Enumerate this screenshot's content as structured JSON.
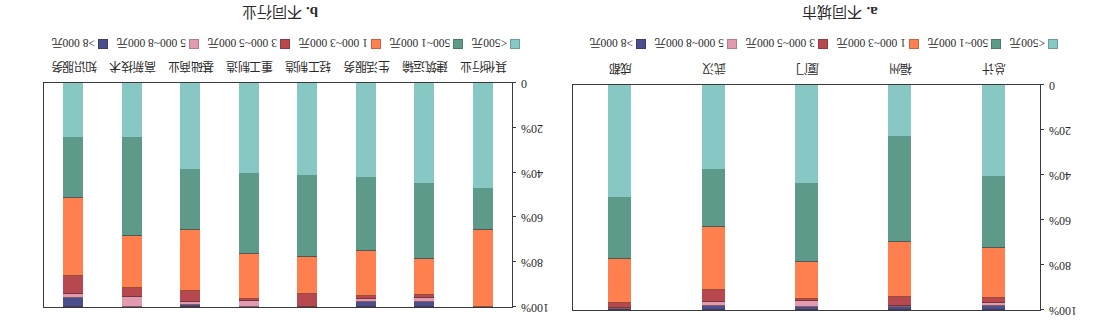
{
  "colors": {
    "lt500": "#87C7C4",
    "r500_1000": "#5E9A8A",
    "r1000_3000": "#FF7F4F",
    "r3000_5000": "#B8484F",
    "r5000_8000": "#E19AB0",
    "gt8000": "#4A4E8C"
  },
  "legend": [
    {
      "key": "lt500",
      "label": "<500元"
    },
    {
      "key": "r500_1000",
      "label": "500~1 000元"
    },
    {
      "key": "r1000_3000",
      "label": "1 000~3 000元"
    },
    {
      "key": "r3000_5000",
      "label": "3 000~5 000元"
    },
    {
      "key": "r5000_8000",
      "label": "5 000~8 000元"
    },
    {
      "key": "gt8000",
      "label": ">8 000元"
    }
  ],
  "y_ticks": [
    "0",
    "20%",
    "40%",
    "60%",
    "80%",
    "100%"
  ],
  "charts": {
    "a": {
      "tag": "a.",
      "title": "不同城市"
    },
    "b": {
      "tag": "b.",
      "title": "不同行业"
    }
  },
  "chart_data": [
    {
      "type": "bar",
      "stacked": true,
      "orientation": "vertical",
      "title": "a. 不同城市",
      "xlabel": "",
      "ylabel": "",
      "ylim": [
        0,
        100
      ],
      "y_ticks": [
        "0",
        "20%",
        "40%",
        "60%",
        "80%",
        "100%"
      ],
      "legend_position": "bottom",
      "rendered_rotation_deg": 180,
      "categories": [
        "总计",
        "福州",
        "厦门",
        "武汉",
        "成都"
      ],
      "series": [
        {
          "name": "<500元",
          "values": [
            40.5,
            22.5,
            43.5,
            37.5,
            50.0
          ]
        },
        {
          "name": "500~1 000元",
          "values": [
            32.0,
            47.5,
            35.0,
            25.5,
            27.5
          ]
        },
        {
          "name": "1 000~3 000元",
          "values": [
            22.0,
            24.5,
            16.5,
            28.0,
            19.5
          ]
        },
        {
          "name": "3 000~5 000元",
          "values": [
            2.3,
            3.7,
            0.8,
            5.5,
            2.0
          ]
        },
        {
          "name": "5 000~8 000元",
          "values": [
            1.5,
            0.3,
            3.0,
            1.8,
            0.5
          ]
        },
        {
          "name": ">8 000元",
          "values": [
            1.7,
            1.5,
            1.2,
            1.7,
            0.5
          ]
        }
      ]
    },
    {
      "type": "bar",
      "stacked": true,
      "orientation": "vertical",
      "title": "b. 不同行业",
      "xlabel": "",
      "ylabel": "",
      "ylim": [
        0,
        100
      ],
      "y_ticks": [
        "0",
        "20%",
        "40%",
        "60%",
        "80%",
        "100%"
      ],
      "legend_position": "bottom",
      "rendered_rotation_deg": 180,
      "categories": [
        "其他行业",
        "建筑运输",
        "生活服务",
        "轻工制造",
        "重工制造",
        "基础商业",
        "高新技术",
        "知识服务"
      ],
      "series": [
        {
          "name": "<500元",
          "values": [
            47.0,
            44.5,
            42.0,
            41.0,
            40.0,
            38.5,
            24.0,
            24.0
          ]
        },
        {
          "name": "500~1 000元",
          "values": [
            18.5,
            34.0,
            33.0,
            36.5,
            36.5,
            27.0,
            44.5,
            27.5
          ]
        },
        {
          "name": "1 000~3 000元",
          "values": [
            34.5,
            16.0,
            20.0,
            16.5,
            20.0,
            27.5,
            23.0,
            34.5
          ]
        },
        {
          "name": "3 000~5 000元",
          "values": [
            0.0,
            1.5,
            1.5,
            6.0,
            1.0,
            5.0,
            4.0,
            8.0
          ]
        },
        {
          "name": "5 000~8 000元",
          "values": [
            0.0,
            2.0,
            1.5,
            0.0,
            2.5,
            1.0,
            4.5,
            2.0
          ]
        },
        {
          "name": ">8 000元",
          "values": [
            0.0,
            2.0,
            2.0,
            0.0,
            0.0,
            1.0,
            0.0,
            4.0
          ]
        }
      ]
    }
  ]
}
